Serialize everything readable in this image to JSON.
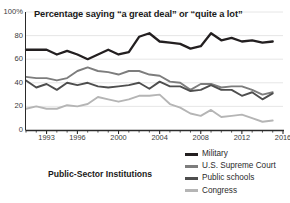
{
  "chart_data": {
    "type": "line",
    "title": "Percentage saying “a great deal” or “quite a lot”",
    "caption": "Public-Sector Institutions",
    "xlabel": "",
    "ylabel": "",
    "xlim": [
      1991,
      2016
    ],
    "ylim": [
      0,
      100
    ],
    "grid": true,
    "grid_axis": "y",
    "legend_position": "bottom-right",
    "y_ticks": [
      0,
      20,
      40,
      60,
      80,
      100
    ],
    "y_tick_labels": [
      "0",
      "20",
      "40",
      "60",
      "80",
      "100%"
    ],
    "x_ticks": [
      1993,
      1996,
      2000,
      2004,
      2008,
      2012,
      2016
    ],
    "x_tick_labels": [
      "1993",
      "1996",
      "2000",
      "2004",
      "2008",
      "2012",
      "2016"
    ],
    "x_minor_ticks_annual": true,
    "x": [
      1991,
      1992,
      1993,
      1994,
      1995,
      1996,
      1997,
      1998,
      1999,
      2000,
      2001,
      2002,
      2003,
      2004,
      2005,
      2006,
      2007,
      2008,
      2009,
      2010,
      2011,
      2012,
      2013,
      2014,
      2015
    ],
    "series": [
      {
        "name": "Military",
        "color": "#231f20",
        "values": [
          68,
          68,
          68,
          64,
          67,
          64,
          60,
          64,
          68,
          64,
          66,
          79,
          82,
          75,
          74,
          73,
          69,
          71,
          82,
          76,
          78,
          75,
          76,
          74,
          75
        ]
      },
      {
        "name": "U.S. Supreme Court",
        "color": "#7d7d7d",
        "values": [
          45,
          44,
          44,
          42,
          44,
          50,
          53,
          50,
          49,
          47,
          50,
          50,
          47,
          46,
          41,
          40,
          34,
          39,
          39,
          36,
          37,
          37,
          34,
          30,
          32
        ]
      },
      {
        "name": "Public schools",
        "color": "#4e4e4e",
        "values": [
          42,
          36,
          39,
          34,
          40,
          38,
          40,
          37,
          36,
          37,
          38,
          40,
          35,
          41,
          37,
          37,
          33,
          34,
          38,
          34,
          34,
          29,
          32,
          26,
          31
        ]
      },
      {
        "name": "Congress",
        "color": "#b5b5b5",
        "values": [
          18,
          20,
          18,
          18,
          21,
          20,
          22,
          28,
          26,
          24,
          26,
          29,
          29,
          30,
          22,
          19,
          14,
          12,
          17,
          11,
          12,
          13,
          10,
          7,
          8
        ]
      }
    ]
  },
  "legend": {
    "items": [
      {
        "label": "Military",
        "color": "#231f20"
      },
      {
        "label": "U.S. Supreme Court",
        "color": "#7d7d7d"
      },
      {
        "label": "Public schools",
        "color": "#4e4e4e"
      },
      {
        "label": "Congress",
        "color": "#b5b5b5"
      }
    ]
  }
}
